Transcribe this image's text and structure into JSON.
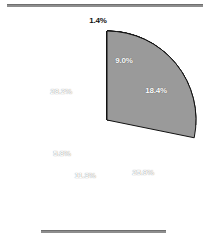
{
  "chart_data": {
    "type": "pie",
    "title": "",
    "subtitle": "",
    "xlabel": "",
    "ylabel": "",
    "legend_position": "none",
    "grid": false,
    "start_angle_deg": 0,
    "direction": "clockwise",
    "total": 100.0,
    "categories": [
      "Slice 1",
      "Slice 2",
      "Slice 3",
      "Slice 4",
      "Slice 5",
      "Slice 6",
      "Slice 7"
    ],
    "values": [
      1.4,
      9.0,
      18.4,
      25.9,
      11.3,
      5.8,
      28.2
    ],
    "labels": [
      "1.4%",
      "9.0%",
      "18.4%",
      "25.9%",
      "11.3%",
      "5.8%",
      "28.2%"
    ],
    "slice_colors": [
      "#2f2f2f",
      "#3a3a3a",
      "#9a9a9a",
      "#3a3a3a",
      "#3a3a3a",
      "#9a9a9a",
      "#9a9a9a"
    ],
    "slices": [
      {
        "label": "1.4%",
        "value": 1.4,
        "color": "#2f2f2f",
        "label_color": "#111111",
        "label_placement": "outside",
        "label_x": 98,
        "label_y": 20
      },
      {
        "label": "9.0%",
        "value": 9.0,
        "color": "#3a3a3a",
        "label_color": "#ffffff",
        "label_placement": "inside",
        "label_x": 124,
        "label_y": 60
      },
      {
        "label": "18.4%",
        "value": 18.4,
        "color": "#9a9a9a",
        "label_color": "#ffffff",
        "label_placement": "inside",
        "label_x": 156,
        "label_y": 90
      },
      {
        "label": "25.9%",
        "value": 25.9,
        "color": "#3a3a3a",
        "label_color": "#ffffff",
        "label_placement": "inside",
        "label_x": 143,
        "label_y": 172
      },
      {
        "label": "11.3%",
        "value": 11.3,
        "color": "#3a3a3a",
        "label_color": "#ffffff",
        "label_placement": "inside",
        "label_x": 85,
        "label_y": 175
      },
      {
        "label": "5.8%",
        "value": 5.8,
        "color": "#9a9a9a",
        "label_color": "#ffffff",
        "label_placement": "inside",
        "label_x": 62,
        "label_y": 153
      },
      {
        "label": "28.2%",
        "value": 28.2,
        "color": "#9a9a9a",
        "label_color": "#ffffff",
        "label_placement": "inside",
        "label_x": 61,
        "label_y": 91
      }
    ],
    "colors": {
      "dark_slice": "#3a3a3a",
      "light_slice": "#9a9a9a",
      "slice_edge": "#111111",
      "rule": "#8e8e8e",
      "background": "#ffffff",
      "inside_label": "#ffffff",
      "outside_label": "#111111"
    },
    "geometry": {
      "center_x": 107,
      "center_y": 120,
      "radius": 89
    }
  },
  "rules": {
    "top_rule_name": "top-divider",
    "bottom_rule_name": "bottom-divider"
  }
}
